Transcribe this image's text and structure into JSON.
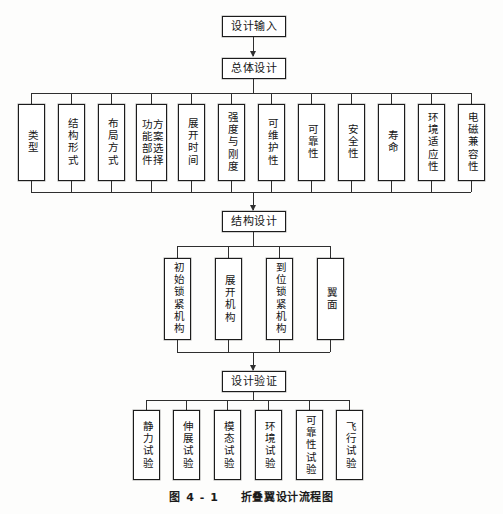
{
  "figure": {
    "caption_number": "图 4 - 1",
    "caption_title": "折叠翼设计流程图",
    "type": "flowchart",
    "orientation": "top-to-bottom",
    "language": "zh-Hans"
  },
  "stages": {
    "design_input": {
      "label": "设计输入",
      "level": 1
    },
    "overall_design": {
      "label": "总体设计",
      "level": 2
    },
    "structural_design": {
      "label": "结构设计",
      "level": 4
    },
    "design_verification": {
      "label": "设计验证",
      "level": 6
    }
  },
  "overall_design_items": [
    {
      "label": "类型"
    },
    {
      "label": "结构形式"
    },
    {
      "label": "布局方式"
    },
    {
      "label": "方案选择",
      "label2": "功能部件",
      "two_column": true
    },
    {
      "label": "展开时间"
    },
    {
      "label": "强度与刚度"
    },
    {
      "label": "可维护性"
    },
    {
      "label": "可靠性"
    },
    {
      "label": "安全性"
    },
    {
      "label": "寿命"
    },
    {
      "label": "环境适应性"
    },
    {
      "label": "电磁兼容性"
    }
  ],
  "structural_design_items": [
    {
      "label": "初始锁紧机构"
    },
    {
      "label": "展开机构"
    },
    {
      "label": "到位锁紧机构"
    },
    {
      "label": "翼面"
    }
  ],
  "design_verification_items": [
    {
      "label": "静力试验"
    },
    {
      "label": "伸展试验"
    },
    {
      "label": "模态试验"
    },
    {
      "label": "环境试验"
    },
    {
      "label": "可靠性试验"
    },
    {
      "label": "飞行试验"
    }
  ],
  "colors": {
    "line": "#2f2f2f",
    "box_border": "#2b2b2b",
    "box_fill": "#ffffff",
    "text": "#141414",
    "page_bg": "#fdfdfc"
  }
}
